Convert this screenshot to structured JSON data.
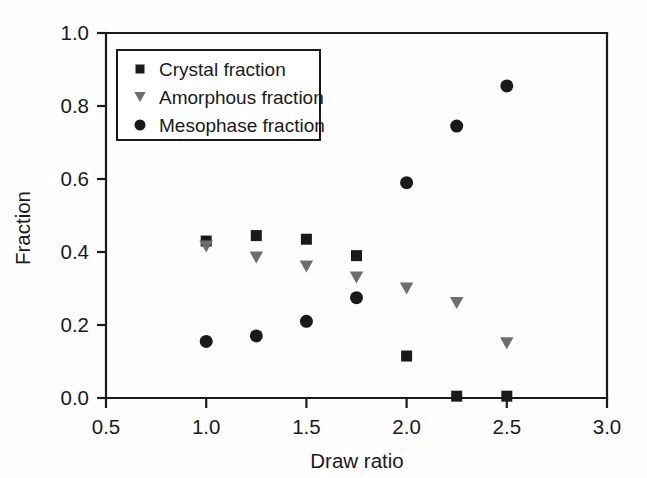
{
  "chart_data": {
    "type": "scatter",
    "title": "",
    "xlabel": "Draw ratio",
    "ylabel": "Fraction",
    "xlim": [
      0.5,
      3.0
    ],
    "ylim": [
      0.0,
      1.0
    ],
    "xticks": [
      0.5,
      1.0,
      1.5,
      2.0,
      2.5,
      3.0
    ],
    "xtick_labels": [
      "0.5",
      "1.0",
      "1.5",
      "2.0",
      "2.5",
      "3.0"
    ],
    "yticks": [
      0.0,
      0.2,
      0.4,
      0.6,
      0.8,
      1.0
    ],
    "ytick_labels": [
      "0.0",
      "0.2",
      "0.4",
      "0.6",
      "0.8",
      "1.0"
    ],
    "grid": false,
    "legend_position": "upper-left-inside",
    "x": [
      1.0,
      1.25,
      1.5,
      1.75,
      2.0,
      2.25,
      2.5
    ],
    "series": [
      {
        "name": "Crystal fraction",
        "marker": "square",
        "color": "#1a1a1a",
        "values": [
          0.43,
          0.445,
          0.435,
          0.39,
          0.115,
          0.005,
          0.005
        ]
      },
      {
        "name": "Amorphous fraction",
        "marker": "triangle-down",
        "color": "#6e6e6e",
        "values": [
          0.415,
          0.385,
          0.36,
          0.33,
          0.3,
          0.26,
          0.15
        ]
      },
      {
        "name": "Mesophase fraction",
        "marker": "circle",
        "color": "#1a1a1a",
        "values": [
          0.155,
          0.17,
          0.21,
          0.275,
          0.59,
          0.745,
          0.855
        ]
      }
    ]
  },
  "axes": {
    "frame_color": "#1a1a1a",
    "x_title": "Draw ratio",
    "y_title": "Fraction"
  },
  "legend": {
    "items": [
      {
        "label": "Crystal fraction",
        "marker": "square",
        "color": "#1a1a1a"
      },
      {
        "label": "Amorphous fraction",
        "marker": "triangle-down",
        "color": "#6e6e6e"
      },
      {
        "label": "Mesophase fraction",
        "marker": "circle",
        "color": "#1a1a1a"
      }
    ]
  }
}
